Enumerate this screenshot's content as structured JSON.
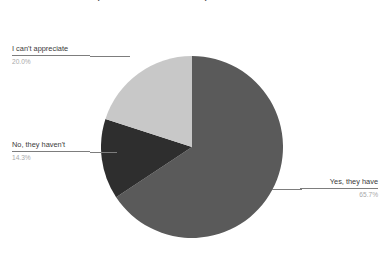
{
  "chart_data": {
    "type": "pie",
    "title": "audience compared to those that are not present in the online environment?",
    "categories": [
      "Yes, they have",
      "I can't appreciate",
      "No, they haven't"
    ],
    "values": [
      65.7,
      20.0,
      14.3
    ],
    "value_labels": [
      "65.7%",
      "20.0%",
      "14.3%"
    ],
    "units": "percent",
    "legend": "none",
    "grid": false,
    "start_angle_deg": 0,
    "direction": "clockwise",
    "colors": [
      "#5a5a5a",
      "#c8c8c8",
      "#2e2e2e"
    ],
    "slices": [
      {
        "label": "Yes, they have",
        "value": 65.7,
        "value_label": "65.7%",
        "color": "#5a5a5a"
      },
      {
        "label": "I can't appreciate",
        "value": 20.0,
        "value_label": "20.0%",
        "color": "#c8c8c8"
      },
      {
        "label": "No, they haven't",
        "value": 14.3,
        "value_label": "14.3%",
        "color": "#2e2e2e"
      }
    ]
  },
  "title": {
    "text": "audience compared to those that are not present in the online environment?"
  },
  "callouts": {
    "appreciate": {
      "label": "I can't appreciate",
      "percent": "20.0%"
    },
    "no": {
      "label": "No, they haven't",
      "percent": "14.3%"
    },
    "yes": {
      "label": "Yes, they have",
      "percent": "65.7%"
    }
  }
}
